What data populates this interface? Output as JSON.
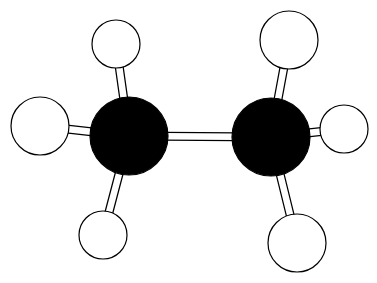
{
  "diagram": {
    "type": "ball-and-stick molecular model",
    "molecule": "ethane",
    "colors": {
      "carbon": "#000000",
      "hydrogen": "#ffffff",
      "outline": "#000000",
      "bond_fill": "#ffffff",
      "background": "#ffffff"
    },
    "atoms": [
      {
        "id": "C1",
        "element": "C",
        "cx": 129,
        "cy": 136,
        "r": 39
      },
      {
        "id": "C2",
        "element": "C",
        "cx": 271,
        "cy": 137,
        "r": 39
      },
      {
        "id": "H1",
        "element": "H",
        "cx": 116,
        "cy": 44,
        "r": 24
      },
      {
        "id": "H2",
        "element": "H",
        "cx": 40,
        "cy": 126,
        "r": 29
      },
      {
        "id": "H3",
        "element": "H",
        "cx": 103,
        "cy": 235,
        "r": 24
      },
      {
        "id": "H4",
        "element": "H",
        "cx": 289,
        "cy": 40,
        "r": 29
      },
      {
        "id": "H5",
        "element": "H",
        "cx": 344,
        "cy": 129,
        "r": 24
      },
      {
        "id": "H6",
        "element": "H",
        "cx": 297,
        "cy": 243,
        "r": 29
      }
    ],
    "bonds": [
      {
        "from": "C1",
        "to": "C2"
      },
      {
        "from": "C1",
        "to": "H1"
      },
      {
        "from": "C1",
        "to": "H2"
      },
      {
        "from": "C1",
        "to": "H3"
      },
      {
        "from": "C2",
        "to": "H4"
      },
      {
        "from": "C2",
        "to": "H5"
      },
      {
        "from": "C2",
        "to": "H6"
      }
    ]
  }
}
